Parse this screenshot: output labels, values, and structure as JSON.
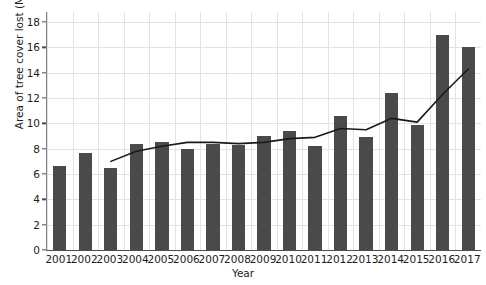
{
  "chart_data": {
    "type": "bar",
    "title": "",
    "xlabel": "Year",
    "ylabel": "Area of tree cover lost (Mha)",
    "categories": [
      "2001",
      "2002",
      "2003",
      "2004",
      "2005",
      "2006",
      "2007",
      "2008",
      "2009",
      "2010",
      "2011",
      "2012",
      "2013",
      "2014",
      "2015",
      "2016",
      "2017"
    ],
    "values": [
      6.6,
      7.7,
      6.45,
      8.4,
      8.5,
      8.0,
      8.4,
      8.3,
      9.0,
      9.4,
      8.2,
      10.6,
      8.9,
      12.4,
      9.9,
      17.0,
      16.0
    ],
    "series": [
      {
        "name": "bars",
        "type": "bar",
        "values": [
          6.6,
          7.7,
          6.45,
          8.4,
          8.5,
          8.0,
          8.4,
          8.3,
          9.0,
          9.4,
          8.2,
          10.6,
          8.9,
          12.4,
          9.9,
          17.0,
          16.0
        ]
      },
      {
        "name": "trend-line",
        "type": "line",
        "x": [
          "2003",
          "2004",
          "2005",
          "2006",
          "2007",
          "2008",
          "2009",
          "2010",
          "2011",
          "2012",
          "2013",
          "2014",
          "2015",
          "2016",
          "2017"
        ],
        "values": [
          7.0,
          7.8,
          8.2,
          8.5,
          8.5,
          8.4,
          8.5,
          8.8,
          8.9,
          9.6,
          9.5,
          10.4,
          10.1,
          12.3,
          14.3
        ]
      }
    ],
    "ylim": [
      0,
      18.8
    ],
    "yticks": [
      0,
      2,
      4,
      6,
      8,
      10,
      12,
      14,
      16,
      18
    ],
    "ytick_labels": [
      "0",
      "2",
      "4",
      "6",
      "8",
      "10",
      "12",
      "14",
      "16",
      "18"
    ],
    "grid": true,
    "legend": "none",
    "bar_color": "#4a4a4a",
    "line_color": "#1a1a1a",
    "grid_color": "#dfe3ea",
    "axis_color": "#4d4d4d"
  }
}
